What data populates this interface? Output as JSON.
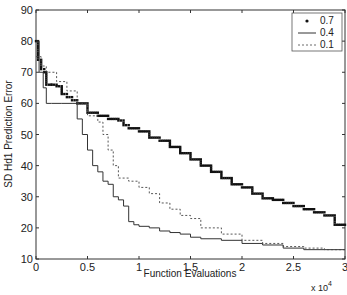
{
  "chart_data": {
    "type": "line",
    "title": "",
    "xlabel": "Function Evaluations",
    "ylabel": "SD Hd1 Prediction Error",
    "x_multiplier": "x 10^4",
    "xlim": [
      0,
      3
    ],
    "ylim": [
      10,
      90
    ],
    "xticks": [
      "0",
      "0.5",
      "1",
      "1.5",
      "2",
      "2.5",
      "3"
    ],
    "yticks": [
      "10",
      "20",
      "30",
      "40",
      "50",
      "60",
      "70",
      "80",
      "90"
    ],
    "grid": false,
    "legend_position": "upper right",
    "series": [
      {
        "name": "0.7",
        "style": "dots",
        "x": [
          0,
          0.02,
          0.05,
          0.08,
          0.1,
          0.15,
          0.2,
          0.25,
          0.3,
          0.35,
          0.4,
          0.5,
          0.6,
          0.7,
          0.8,
          0.85,
          0.9,
          1.0,
          1.1,
          1.2,
          1.3,
          1.4,
          1.5,
          1.6,
          1.7,
          1.8,
          1.9,
          2.0,
          2.1,
          2.2,
          2.3,
          2.4,
          2.5,
          2.6,
          2.7,
          2.8,
          2.9,
          3.0
        ],
        "values": [
          80,
          74,
          71,
          70,
          66,
          66,
          65.5,
          63,
          62,
          61,
          60,
          57,
          56,
          55,
          54.5,
          53,
          52,
          51,
          49,
          48,
          46,
          44,
          42,
          40,
          38,
          36,
          34,
          33,
          31,
          29.5,
          29,
          28,
          27,
          26,
          25,
          24,
          21,
          20
        ]
      },
      {
        "name": "0.4",
        "style": "solid",
        "x": [
          0,
          0.03,
          0.07,
          0.1,
          0.15,
          0.25,
          0.35,
          0.4,
          0.45,
          0.5,
          0.55,
          0.6,
          0.65,
          0.7,
          0.75,
          0.8,
          0.85,
          0.9,
          0.95,
          1.0,
          1.1,
          1.2,
          1.3,
          1.4,
          1.5,
          1.6,
          1.8,
          2.0,
          2.2,
          2.4,
          2.6,
          2.8,
          3.0
        ],
        "values": [
          80,
          70,
          65,
          60,
          60,
          60,
          60,
          55,
          50,
          45,
          40,
          38,
          35,
          34,
          30,
          29,
          27,
          22,
          21,
          20.5,
          20,
          19,
          18.5,
          18,
          17,
          16.5,
          16,
          15,
          14.5,
          13.5,
          13,
          13,
          13
        ]
      },
      {
        "name": "0.1",
        "style": "dashed",
        "x": [
          0,
          0.05,
          0.1,
          0.2,
          0.3,
          0.4,
          0.5,
          0.6,
          0.65,
          0.7,
          0.75,
          0.8,
          0.9,
          1.0,
          1.1,
          1.2,
          1.3,
          1.4,
          1.5,
          1.6,
          1.8,
          2.0,
          2.2,
          2.4,
          2.6,
          2.8,
          3.0
        ],
        "values": [
          75,
          72,
          70,
          67,
          64,
          60,
          56,
          54,
          50,
          45,
          40,
          36,
          35,
          33,
          31,
          28,
          26,
          24,
          23,
          20,
          18,
          16,
          15,
          14,
          13.5,
          13,
          13
        ]
      }
    ]
  },
  "legend": {
    "items": [
      {
        "label": "0.7",
        "style": "dots"
      },
      {
        "label": "0.4",
        "style": "solid"
      },
      {
        "label": "0.1",
        "style": "dashed"
      }
    ]
  },
  "axes": {
    "xlabel": "Function Evaluations",
    "ylabel": "SD Hd1 Prediction Error",
    "x_multiplier_base": "x 10",
    "x_multiplier_exp": "4"
  },
  "colors": {
    "line": "#222222",
    "axis": "#333333",
    "background": "#ffffff"
  }
}
